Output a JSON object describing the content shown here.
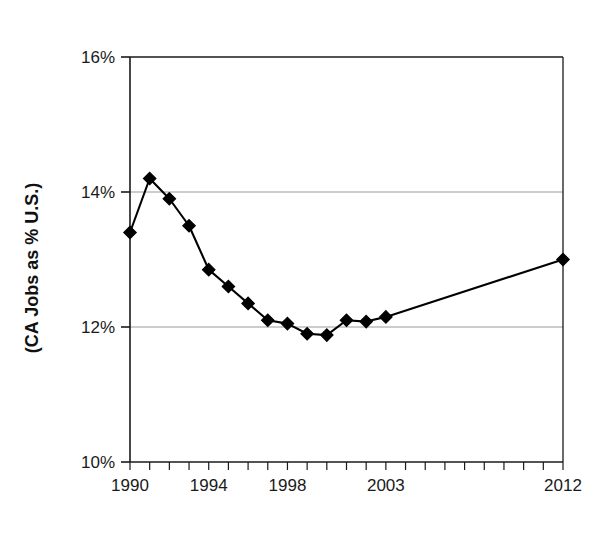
{
  "chart_data": {
    "type": "line",
    "title": "",
    "xlabel": "",
    "ylabel": "(CA Jobs as % U.S.)",
    "xlim": [
      1990,
      2012
    ],
    "ylim": [
      10,
      16
    ],
    "grid": true,
    "legend": false,
    "y_tick_labels": [
      "16%",
      "14%",
      "12%",
      "10%"
    ],
    "y_tick_values": [
      16,
      14,
      12,
      10
    ],
    "x_tick_labels": [
      "1990",
      "1994",
      "1998",
      "2003",
      "2012"
    ],
    "x_tick_values": [
      1990,
      1994,
      1998,
      2003,
      2012
    ],
    "x_minor_ticks": [
      1990,
      1991,
      1992,
      1993,
      1994,
      1995,
      1996,
      1997,
      1998,
      1999,
      2000,
      2001,
      2002,
      2003,
      2004,
      2005,
      2006,
      2007,
      2008,
      2009,
      2010,
      2011,
      2012
    ],
    "marker": "diamond",
    "series": [
      {
        "name": "CA Jobs as % U.S.",
        "color": "#000000",
        "x": [
          1990,
          1991,
          1992,
          1993,
          1994,
          1995,
          1996,
          1997,
          1998,
          1999,
          2000,
          2001,
          2002,
          2003,
          2012
        ],
        "values": [
          13.4,
          14.2,
          13.9,
          13.5,
          12.85,
          12.6,
          12.35,
          12.1,
          12.05,
          11.9,
          11.88,
          12.1,
          12.08,
          12.15,
          13.0
        ]
      }
    ]
  },
  "style": {
    "axis_color": "#1a1a1a",
    "grid_color": "#9a9a9a",
    "line_color": "#000000",
    "marker_color": "#000000",
    "background": "#ffffff"
  }
}
